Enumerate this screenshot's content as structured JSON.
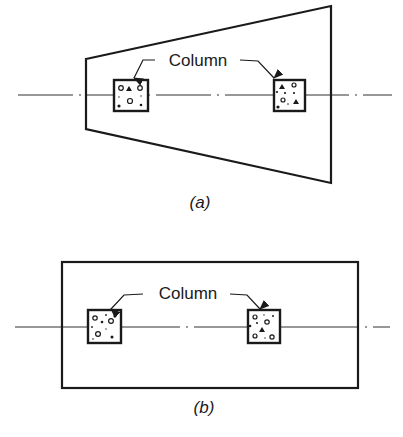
{
  "figure_a": {
    "caption": "(a)",
    "shape": "trapezoidal footing",
    "callout_label": "Column",
    "columns": [
      "left-column",
      "right-column"
    ]
  },
  "figure_b": {
    "caption": "(b)",
    "shape": "rectangular footing",
    "callout_label": "Column",
    "columns": [
      "left-column",
      "right-column"
    ]
  },
  "colors": {
    "stroke": "#1a1a1a",
    "background": "#ffffff"
  }
}
